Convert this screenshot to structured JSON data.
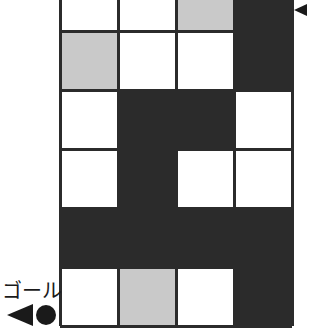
{
  "diagram": {
    "kind": "grid-maze",
    "colors": {
      "wall": "#2b2b2b",
      "path": "#ffffff",
      "marked": "#c9c9c9",
      "line": "#2b2b2b",
      "background": "#ffffff",
      "text": "#1a1a1a"
    },
    "grid": {
      "columns": 4,
      "rows": 6,
      "cell_width": 58,
      "cell_height": 59,
      "origin_x": 60,
      "origin_y": -28,
      "top_row_clipped": true,
      "bottom_row_clipped": true
    },
    "cells": [
      [
        "white",
        "white",
        "gray",
        "dark"
      ],
      [
        "gray",
        "white",
        "white",
        "dark"
      ],
      [
        "white",
        "dark",
        "dark",
        "white"
      ],
      [
        "white",
        "dark",
        "white",
        "white"
      ],
      [
        "dark",
        "dark",
        "dark",
        "dark"
      ],
      [
        "white",
        "gray",
        "white",
        "dark"
      ]
    ]
  },
  "labels": {
    "goal": "ゴール"
  },
  "markers": {
    "goal_arrow": "left-triangle-icon",
    "goal_dot": "circle-icon",
    "entry_pointer": "left-triangle-icon"
  }
}
